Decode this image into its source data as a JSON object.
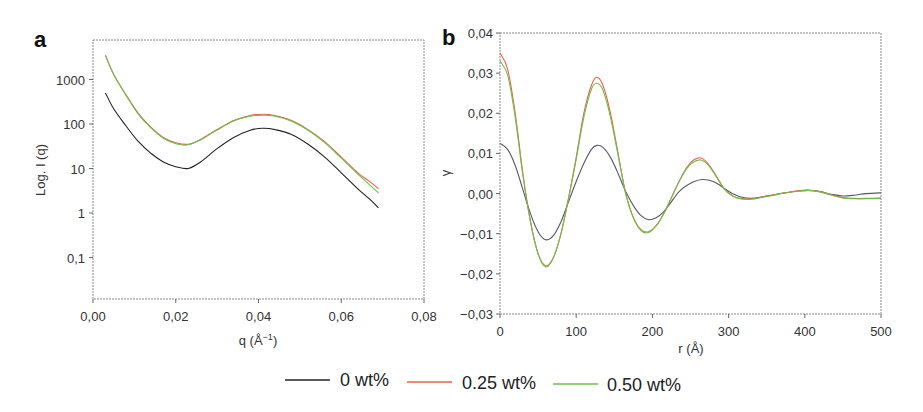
{
  "chart_data": [
    {
      "panel": "a",
      "type": "line",
      "title": "",
      "xlabel": "q (Å⁻¹)",
      "ylabel": "Log. I (q)",
      "yscale": "log",
      "xlim": [
        0.0,
        0.08
      ],
      "ylim": [
        0.01,
        7000
      ],
      "x_ticks": [
        "0,00",
        "0,02",
        "0,04",
        "0,06",
        "0,08"
      ],
      "y_ticks": [
        "0,1",
        "1",
        "10",
        "100",
        "1000"
      ],
      "grid": false,
      "x": [
        0.003,
        0.005,
        0.008,
        0.011,
        0.014,
        0.017,
        0.02,
        0.023,
        0.026,
        0.03,
        0.034,
        0.038,
        0.041,
        0.044,
        0.048,
        0.052,
        0.056,
        0.06,
        0.064,
        0.067,
        0.069
      ],
      "series": [
        {
          "name": "0 wt%",
          "color": "#222222",
          "values": [
            500,
            220,
            90,
            40,
            22,
            14,
            11,
            10,
            14,
            28,
            50,
            72,
            80,
            75,
            58,
            35,
            18,
            8,
            3.5,
            2.0,
            1.3
          ]
        },
        {
          "name": "0.25 wt%",
          "color": "#e8604a",
          "values": [
            3500,
            1300,
            450,
            170,
            85,
            50,
            38,
            35,
            45,
            75,
            120,
            155,
            165,
            155,
            120,
            75,
            40,
            18,
            8,
            5,
            3.5
          ]
        },
        {
          "name": "0.50 wt%",
          "color": "#6cc04a",
          "values": [
            3500,
            1300,
            440,
            165,
            82,
            48,
            36,
            34,
            44,
            73,
            117,
            150,
            158,
            150,
            115,
            72,
            38,
            17,
            7.5,
            4.2,
            2.8
          ]
        }
      ]
    },
    {
      "panel": "b",
      "type": "line",
      "title": "",
      "xlabel": "r (Å)",
      "ylabel": "γ",
      "xlim": [
        0,
        500
      ],
      "ylim": [
        -0.03,
        0.04
      ],
      "x_ticks": [
        "0",
        "100",
        "200",
        "300",
        "400",
        "500"
      ],
      "y_ticks": [
        "0,04",
        "0,03",
        "0,02",
        "0,01",
        "0,00",
        "−0,01",
        "−0,02",
        "−0,03"
      ],
      "grid": false,
      "x": [
        0,
        10,
        20,
        30,
        40,
        50,
        60,
        70,
        80,
        90,
        100,
        110,
        120,
        127,
        135,
        145,
        155,
        165,
        175,
        185,
        195,
        205,
        215,
        225,
        235,
        245,
        255,
        265,
        275,
        285,
        295,
        305,
        315,
        330,
        345,
        360,
        375,
        390,
        405,
        420,
        435,
        450,
        465,
        480,
        500
      ],
      "series": [
        {
          "name": "0 wt%",
          "color": "#555a66",
          "values": [
            0.0125,
            0.011,
            0.007,
            0.001,
            -0.005,
            -0.0095,
            -0.0115,
            -0.0105,
            -0.007,
            -0.002,
            0.003,
            0.0075,
            0.011,
            0.012,
            0.0115,
            0.009,
            0.005,
            0.0005,
            -0.003,
            -0.0055,
            -0.0065,
            -0.006,
            -0.0045,
            -0.002,
            0.0005,
            0.002,
            0.003,
            0.0035,
            0.0033,
            0.0025,
            0.0012,
            0.0,
            -0.0008,
            -0.0012,
            -0.0008,
            -0.0003,
            0.0002,
            0.0006,
            0.0008,
            0.0005,
            -0.0002,
            -0.0006,
            -0.0004,
            0.0,
            0.0002
          ]
        },
        {
          "name": "0.25 wt%",
          "color": "#e8604a",
          "values": [
            0.035,
            0.031,
            0.02,
            0.005,
            -0.007,
            -0.015,
            -0.018,
            -0.016,
            -0.01,
            -0.001,
            0.009,
            0.02,
            0.027,
            0.029,
            0.027,
            0.02,
            0.01,
            0.0,
            -0.006,
            -0.009,
            -0.0095,
            -0.008,
            -0.005,
            -0.001,
            0.003,
            0.0065,
            0.0085,
            0.0088,
            0.007,
            0.004,
            0.001,
            -0.0005,
            -0.0012,
            -0.0013,
            -0.0008,
            -0.0003,
            0.0002,
            0.0007,
            0.0009,
            0.0005,
            -0.0003,
            -0.001,
            -0.0012,
            -0.0012,
            -0.0011
          ]
        },
        {
          "name": "0.50 wt%",
          "color": "#6cc04a",
          "values": [
            0.033,
            0.0295,
            0.019,
            0.0045,
            -0.007,
            -0.015,
            -0.0183,
            -0.016,
            -0.01,
            -0.0012,
            0.0085,
            0.019,
            0.026,
            0.0275,
            0.0258,
            0.019,
            0.0095,
            0.0,
            -0.006,
            -0.0092,
            -0.0097,
            -0.008,
            -0.005,
            -0.001,
            0.003,
            0.0062,
            0.008,
            0.0083,
            0.0067,
            0.0038,
            0.001,
            -0.0006,
            -0.0013,
            -0.0014,
            -0.0009,
            -0.0004,
            0.0002,
            0.0006,
            0.0008,
            0.0004,
            -0.0004,
            -0.0011,
            -0.0013,
            -0.0013,
            -0.0012
          ]
        }
      ]
    }
  ],
  "panels": {
    "a": {
      "label": "a",
      "xlabel": "q (Å",
      "xlabel_sup": "−1",
      "xlabel_close": ")",
      "ylabel": "Log. I (q)"
    },
    "b": {
      "label": "b",
      "xlabel": "r (Å)",
      "ylabel": "γ"
    }
  },
  "legend": [
    {
      "label": "0 wt%",
      "color": "#222222"
    },
    {
      "label": "0.25 wt%",
      "color": "#e8604a"
    },
    {
      "label": "0.50 wt%",
      "color": "#6cc04a"
    }
  ]
}
